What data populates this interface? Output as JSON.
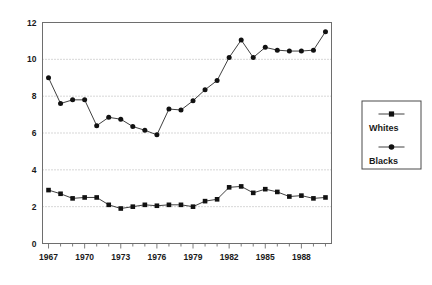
{
  "chart_data": {
    "type": "line",
    "title": "",
    "subtitle": "",
    "xlabel": "",
    "ylabel": "",
    "x": [
      1967,
      1968,
      1969,
      1970,
      1971,
      1972,
      1973,
      1974,
      1975,
      1976,
      1977,
      1978,
      1979,
      1980,
      1981,
      1982,
      1983,
      1984,
      1985,
      1986,
      1987,
      1988,
      1989,
      1990
    ],
    "xtick_labels": [
      "1967",
      "1970",
      "1973",
      "1976",
      "1979",
      "1982",
      "1985",
      "1988"
    ],
    "xtick_values": [
      1967,
      1970,
      1973,
      1976,
      1979,
      1982,
      1985,
      1988
    ],
    "ytick_labels": [
      "0",
      "2",
      "4",
      "6",
      "8",
      "10",
      "12"
    ],
    "ytick_values": [
      0,
      2,
      4,
      6,
      8,
      10,
      12
    ],
    "ylim": [
      0,
      12
    ],
    "xlim": [
      1966.5,
      1990.5
    ],
    "grid": true,
    "grid_axis": "y",
    "legend_position": "right",
    "series": [
      {
        "name": "Whites",
        "marker": "square",
        "values": [
          2.9,
          2.7,
          2.45,
          2.5,
          2.5,
          2.1,
          1.9,
          2.0,
          2.1,
          2.05,
          2.1,
          2.1,
          2.0,
          2.3,
          2.4,
          3.05,
          3.1,
          2.75,
          2.95,
          2.8,
          2.55,
          2.6,
          2.45,
          2.5
        ]
      },
      {
        "name": "Blacks",
        "marker": "circle",
        "values": [
          9.0,
          7.6,
          7.8,
          7.8,
          6.4,
          6.85,
          6.75,
          6.35,
          6.15,
          5.9,
          7.3,
          7.25,
          7.75,
          8.35,
          8.85,
          10.1,
          11.05,
          10.1,
          10.65,
          10.5,
          10.45,
          10.45,
          10.5,
          11.5
        ]
      }
    ]
  },
  "legend": {
    "items": [
      {
        "label": "Whites",
        "marker": "square"
      },
      {
        "label": "Blacks",
        "marker": "circle"
      }
    ]
  }
}
